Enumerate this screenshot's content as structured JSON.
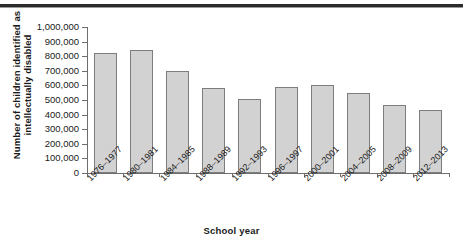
{
  "chart_data": {
    "type": "bar",
    "title": "",
    "xlabel": "School year",
    "ylabel": "Number of children identified as intellectually disabled",
    "ylabel_line1": "Number of children identified as",
    "ylabel_line2": "intellectually disabled",
    "categories": [
      "1976–1977",
      "1980–1981",
      "1984–1985",
      "1988–1989",
      "1992–1993",
      "1996–1997",
      "2000–2001",
      "2004–2005",
      "2008–2009",
      "2012–2013"
    ],
    "values": [
      825000,
      840000,
      700000,
      585000,
      510000,
      590000,
      605000,
      550000,
      465000,
      435000
    ],
    "ylim": [
      0,
      1000000
    ],
    "ytick_values": [
      0,
      100000,
      200000,
      300000,
      400000,
      500000,
      600000,
      700000,
      800000,
      900000,
      1000000
    ],
    "ytick_labels": [
      "0",
      "100,000",
      "200,000",
      "300,000",
      "400,000",
      "500,000",
      "600,000",
      "700,000",
      "800,000",
      "900,000",
      "1,000,000"
    ],
    "grid": false,
    "legend": null,
    "bar_fill": "#d2d2d2",
    "bar_border": "#7d7d7d",
    "axis_color": "#6e6e6e"
  }
}
